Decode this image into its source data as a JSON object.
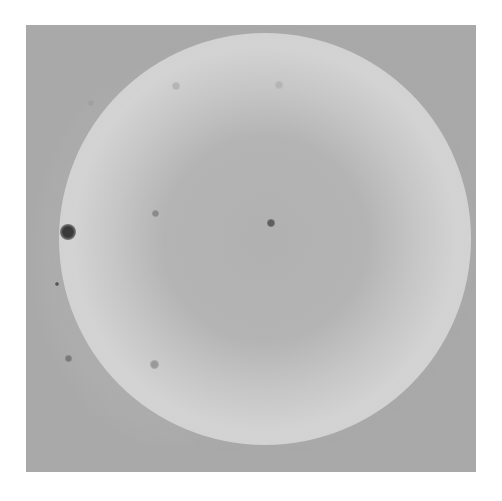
{
  "image": {
    "description": "Grayscale photograph of a circular disk with darker center and scattered dark spots",
    "colors": {
      "background": "#a9a9a9",
      "disk_rim": "#d3d3d3",
      "disk_center": "#b1b1b1",
      "spot": "#3c3c3c"
    },
    "spots": [
      {
        "x": 42,
        "y": 207,
        "size": 16,
        "color": "#3a3a3a"
      },
      {
        "x": 31,
        "y": 259,
        "size": 4,
        "color": "#555555"
      },
      {
        "x": 42,
        "y": 333,
        "size": 7,
        "color": "#7a7a7a"
      },
      {
        "x": 129,
        "y": 188,
        "size": 7,
        "color": "#8a8a8a"
      },
      {
        "x": 245,
        "y": 198,
        "size": 8,
        "color": "#5e5e5e"
      },
      {
        "x": 128,
        "y": 339,
        "size": 9,
        "color": "#999999"
      },
      {
        "x": 150,
        "y": 61,
        "size": 8,
        "color": "#b5b5b5"
      },
      {
        "x": 253,
        "y": 60,
        "size": 8,
        "color": "#b5b5b5"
      },
      {
        "x": 65,
        "y": 78,
        "size": 6,
        "color": "#a0a0a0"
      }
    ]
  }
}
